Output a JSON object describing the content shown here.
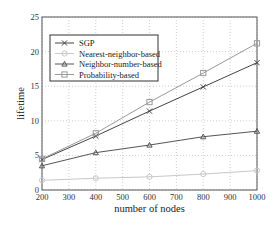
{
  "chart_data": {
    "type": "line",
    "title": "",
    "xlabel": "number of nodes",
    "ylabel": "lifetime",
    "x": [
      200,
      400,
      600,
      800,
      1000
    ],
    "xlim": [
      200,
      1000
    ],
    "ylim": [
      0,
      25
    ],
    "xticks": [
      200,
      300,
      400,
      500,
      600,
      700,
      800,
      900,
      1000
    ],
    "yticks": [
      0,
      5,
      10,
      15,
      20,
      25
    ],
    "grid": true,
    "legend_position": "upper left",
    "series": [
      {
        "name": "SGP",
        "marker": "x",
        "color": "#444444",
        "values": [
          4.4,
          7.8,
          11.4,
          14.9,
          18.4
        ]
      },
      {
        "name": "Nearest-neighbor-based",
        "marker": "o",
        "color": "#c8c8c8",
        "values": [
          1.4,
          1.7,
          1.9,
          2.3,
          2.8
        ]
      },
      {
        "name": "Neighbor-number-based",
        "marker": "^",
        "color": "#555555",
        "values": [
          3.5,
          5.4,
          6.5,
          7.7,
          8.5
        ]
      },
      {
        "name": "Probability-based",
        "marker": "s",
        "color": "#999999",
        "values": [
          4.5,
          8.2,
          12.7,
          16.9,
          21.2
        ]
      }
    ]
  }
}
